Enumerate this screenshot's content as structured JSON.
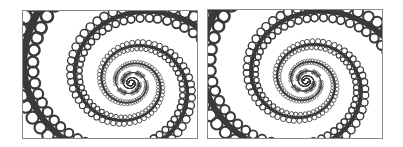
{
  "figure": {
    "panels": [
      {
        "id": "left",
        "x": 22,
        "y": 10,
        "width": 176,
        "height": 129,
        "center_x": 108,
        "center_y": 72,
        "rotation": 0
      },
      {
        "id": "right",
        "x": 207,
        "y": 9,
        "width": 176,
        "height": 130,
        "center_x": 98,
        "center_y": 71,
        "rotation": 0.12
      }
    ],
    "colors": {
      "background": "#ffffff",
      "border": "#8a8a8a",
      "ink": "#3a3a3a"
    }
  }
}
